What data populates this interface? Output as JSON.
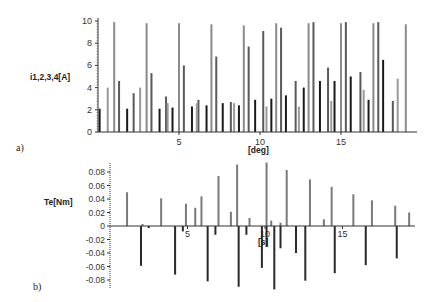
{
  "chart_data": [
    {
      "panel": "a)",
      "type": "bar",
      "title": "",
      "xlabel": "[deg]",
      "ylabel": "i1,2,3,4[A]",
      "xlim": [
        0,
        19.5
      ],
      "ylim": [
        0,
        10
      ],
      "xticks": [
        5,
        10,
        15
      ],
      "yticks": [
        0,
        2,
        4,
        6,
        8,
        10
      ],
      "grid": false,
      "legend": null,
      "description": "Pulsed phase currents of four phases (i1..i4) in shades of gray; tall ~10 A pulses interleaved with smaller pulses.",
      "series": [
        {
          "name": "i-tall (light gray)",
          "color": "#8a8a8a",
          "x": [
            1.0,
            3.0,
            5.0,
            7.0,
            9.0,
            11.0,
            13.0,
            15.0,
            17.0,
            19.0
          ],
          "values": [
            9.9,
            9.8,
            9.8,
            9.7,
            9.6,
            9.8,
            9.8,
            9.8,
            9.8,
            9.7
          ]
        },
        {
          "name": "i-mid (medium gray)",
          "color": "#5a5a5a",
          "x": [
            1.3,
            2.2,
            3.3,
            4.2,
            5.3,
            6.2,
            7.3,
            8.2,
            9.3,
            10.2,
            11.3,
            12.2,
            13.3,
            14.2,
            15.3,
            16.2,
            17.3,
            18.2
          ],
          "values": [
            4.6,
            3.5,
            5.3,
            3.2,
            6.0,
            2.9,
            6.8,
            2.7,
            7.7,
            9.1,
            9.4,
            4.6,
            9.9,
            5.8,
            9.9,
            5.4,
            9.9,
            2.8
          ]
        },
        {
          "name": "i-low (dark)",
          "color": "#1a1a1a",
          "x": [
            0.1,
            1.8,
            3.8,
            4.6,
            5.8,
            6.7,
            7.7,
            8.7,
            9.7,
            10.7,
            11.6,
            12.7,
            13.7,
            14.6,
            15.6,
            16.7,
            17.6
          ],
          "values": [
            2.1,
            2.1,
            2.1,
            2.2,
            2.3,
            2.4,
            2.6,
            2.4,
            2.9,
            3.0,
            3.3,
            4.0,
            4.6,
            4.6,
            5.0,
            2.9,
            6.5
          ]
        },
        {
          "name": "i-small (light)",
          "color": "#9a9a9a",
          "x": [
            0.6,
            2.6,
            4.3,
            6.1,
            8.4,
            10.4,
            12.4,
            14.4,
            16.4,
            18.5
          ],
          "values": [
            4.0,
            4.0,
            2.6,
            2.6,
            2.6,
            2.3,
            2.3,
            2.8,
            3.8,
            4.8
          ]
        }
      ]
    },
    {
      "panel": "b)",
      "type": "bar",
      "title": "",
      "xlabel": "[s]",
      "ylabel": "Te[Nm]",
      "xlim": [
        0,
        19.5
      ],
      "ylim": [
        -0.09,
        0.09
      ],
      "xticks": [
        5,
        10,
        15
      ],
      "yticks": [
        0.08,
        0.06,
        0.04,
        0.02,
        0,
        -0.02,
        -0.04,
        -0.06,
        -0.08
      ],
      "grid": false,
      "legend": null,
      "description": "Electromagnetic torque: alternating positive (gray) and negative (dark) spikes.",
      "series": [
        {
          "name": "Te positive",
          "color": "#7a7a7a",
          "x": [
            1.1,
            3.3,
            4.9,
            5.9,
            5.5,
            7.0,
            7.8,
            8.2,
            9.0,
            10.1,
            11.4,
            12.9,
            14.3,
            15.7,
            16.9,
            18.4,
            19.3,
            2.1,
            13.8,
            10.4,
            11.0
          ],
          "values": [
            0.05,
            0.041,
            0.033,
            0.044,
            0.027,
            0.074,
            0.021,
            0.091,
            0.012,
            0.094,
            0.083,
            0.069,
            0.058,
            0.047,
            0.038,
            0.03,
            0.02,
            0.003,
            0.01,
            0.008,
            0.005
          ]
        },
        {
          "name": "Te negative",
          "color": "#2a2a2a",
          "x": [
            2.0,
            4.2,
            6.3,
            8.3,
            10.6,
            12.6,
            14.5,
            16.5,
            18.5,
            2.5,
            4.7,
            6.8,
            8.8,
            9.8,
            10.1,
            11.0,
            12.0
          ],
          "values": [
            -0.059,
            -0.072,
            -0.082,
            -0.09,
            -0.094,
            -0.081,
            -0.07,
            -0.058,
            -0.048,
            -0.003,
            -0.008,
            -0.013,
            -0.013,
            -0.062,
            -0.03,
            -0.033,
            -0.04
          ]
        }
      ]
    }
  ],
  "figure": {
    "panel_a_label": "a)",
    "panel_b_label": "b)",
    "a_ylabel": "i1,2,3,4[A]",
    "a_xlabel": "[deg]",
    "b_ylabel": "Te[Nm]",
    "b_xlabel": "[s]"
  }
}
